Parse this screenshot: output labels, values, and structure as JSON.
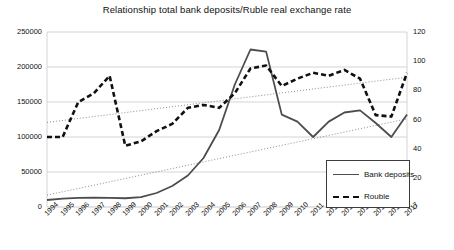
{
  "chart_data": {
    "type": "line",
    "title": "Relationship total bank deposits/Ruble real exchange rate",
    "xlabel": "",
    "ylabel": "",
    "grid": true,
    "legend_position": "bottom-right",
    "categories": [
      "1994",
      "1995",
      "1996",
      "1997",
      "1998",
      "1999",
      "2000",
      "2001",
      "2002",
      "2003",
      "2004",
      "2005",
      "2006",
      "2007",
      "2008",
      "2009",
      "2010",
      "2011",
      "2012",
      "2013",
      "2014",
      "2015",
      "2016",
      "2017"
    ],
    "axes": {
      "left": {
        "label": "",
        "ylim": [
          0,
          250000
        ],
        "ticks": [
          0,
          50000,
          100000,
          150000,
          200000,
          250000
        ],
        "tick_labels": [
          "0",
          "50000",
          "100000",
          "150000",
          "200000",
          "250000"
        ]
      },
      "right": {
        "label": "",
        "ylim": [
          0,
          120
        ],
        "ticks": [
          0,
          20,
          40,
          60,
          80,
          100,
          120
        ],
        "tick_labels": [
          "0",
          "20",
          "40",
          "60",
          "80",
          "100",
          "120"
        ]
      }
    },
    "series": [
      {
        "name": "Bank deposits",
        "axis": "left",
        "style": "solid",
        "color": "#4d4d4d",
        "values": [
          10000,
          12000,
          13000,
          13500,
          13000,
          12500,
          14000,
          20000,
          30000,
          45000,
          70000,
          110000,
          175000,
          225000,
          222000,
          132000,
          122000,
          100000,
          122000,
          135000,
          138000,
          120000,
          100000,
          132000
        ]
      },
      {
        "name": "Rouble",
        "axis": "right",
        "style": "dashed",
        "color": "#111111",
        "values": [
          48,
          48,
          72,
          78,
          90,
          42,
          45,
          52,
          57,
          68,
          70,
          68,
          78,
          95,
          97,
          83,
          88,
          92,
          90,
          94,
          88,
          63,
          62,
          92
        ]
      }
    ],
    "trendlines": [
      {
        "name": "Rouble trendline",
        "axis": "right",
        "style": "dotted",
        "color": "#8c8c8c",
        "start_value": 58,
        "end_value": 89
      },
      {
        "name": "Bank deposits trendline",
        "axis": "left",
        "style": "dotted",
        "color": "#8c8c8c",
        "start_value": 17000,
        "end_value": 126000
      }
    ]
  },
  "legend": {
    "items": [
      {
        "label": "Bank deposits",
        "style": "solid"
      },
      {
        "label": "Rouble",
        "style": "dashed"
      }
    ]
  }
}
